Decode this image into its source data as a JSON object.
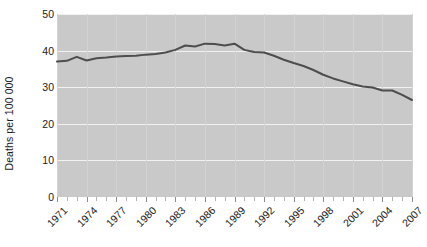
{
  "chart_data": {
    "type": "line",
    "title": "",
    "xlabel": "",
    "ylabel": "Deaths per 100 000",
    "xlim": [
      1971,
      2007
    ],
    "ylim": [
      0,
      50
    ],
    "grid": "horizontal-major-white",
    "legend": "none",
    "y_ticks": [
      0,
      10,
      20,
      30,
      40,
      50
    ],
    "y_tick_labels": [
      "0",
      "10",
      "20",
      "30",
      "40",
      "50"
    ],
    "x_tick_labels": [
      "1971",
      "1974",
      "1977",
      "1980",
      "1983",
      "1986",
      "1989",
      "1992",
      "1995",
      "1998",
      "2001",
      "2004",
      "2007"
    ],
    "x_tick_values": [
      1971,
      1974,
      1977,
      1980,
      1983,
      1986,
      1989,
      1992,
      1995,
      1998,
      2001,
      2004,
      2007
    ],
    "x_minor_tick_interval": 1,
    "series": [
      {
        "name": "Deaths per 100 000",
        "color": "#4d4d4d",
        "line_width": 2,
        "x": [
          1971,
          1972,
          1973,
          1974,
          1975,
          1976,
          1977,
          1978,
          1979,
          1980,
          1981,
          1982,
          1983,
          1984,
          1985,
          1986,
          1987,
          1988,
          1989,
          1990,
          1991,
          1992,
          1993,
          1994,
          1995,
          1996,
          1997,
          1998,
          1999,
          2000,
          2001,
          2002,
          2003,
          2004,
          2005,
          2006,
          2007
        ],
        "values": [
          37.0,
          37.2,
          38.3,
          37.3,
          37.9,
          38.1,
          38.4,
          38.5,
          38.6,
          38.9,
          39.1,
          39.5,
          40.2,
          41.4,
          41.1,
          41.9,
          41.8,
          41.4,
          41.9,
          40.2,
          39.6,
          39.5,
          38.6,
          37.5,
          36.6,
          35.8,
          34.7,
          33.4,
          32.4,
          31.6,
          30.8,
          30.2,
          29.9,
          29.1,
          29.1,
          27.9,
          26.5
        ]
      }
    ]
  },
  "axes": {
    "y_axis_title": "Deaths per 100 000"
  }
}
